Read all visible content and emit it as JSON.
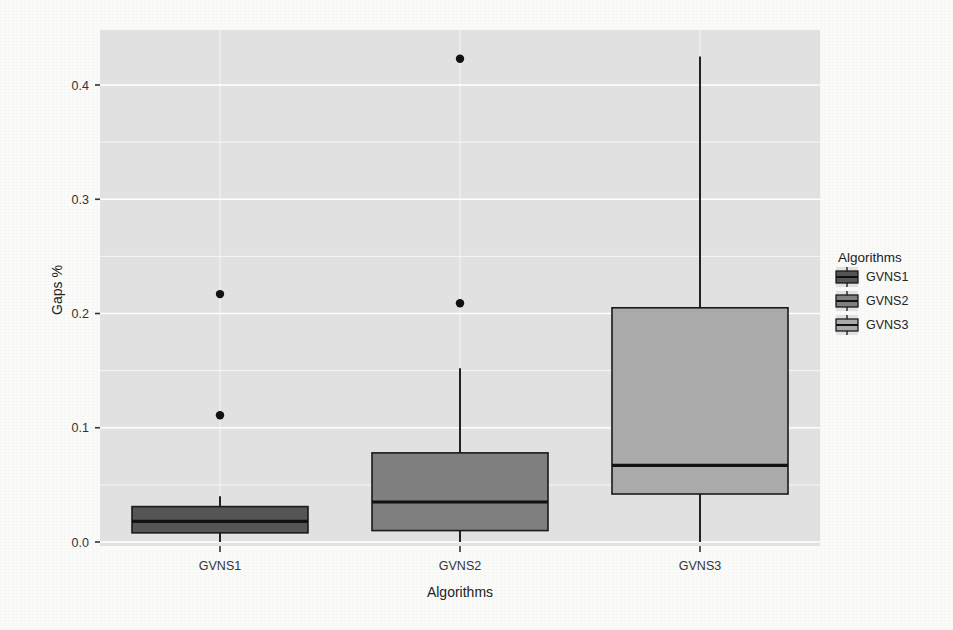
{
  "chart_data": {
    "type": "box",
    "title": "",
    "xlabel": "Algorithms",
    "ylabel": "Gaps %",
    "ylim": [
      -0.02,
      0.45
    ],
    "grid": true,
    "grid_major": true,
    "grid_minor": true,
    "panel_background": "#e0e0e0",
    "grid_color": "#ffffff",
    "legend": {
      "title": "Algorithms",
      "position": "right",
      "entries": [
        {
          "label": "GVNS1",
          "color": "#555555"
        },
        {
          "label": "GVNS2",
          "color": "#7f7f7f"
        },
        {
          "label": "GVNS3",
          "color": "#aaaaaa"
        }
      ]
    },
    "y_ticks": [
      0.0,
      0.1,
      0.2,
      0.3,
      0.4
    ],
    "y_tick_labels": [
      "0.0",
      "0.1",
      "0.2",
      "0.3",
      "0.4"
    ],
    "categories": [
      "GVNS1",
      "GVNS2",
      "GVNS3"
    ],
    "boxes": [
      {
        "category": "GVNS1",
        "color": "#555555",
        "lower_whisker": 0.0,
        "q1": 0.008,
        "median": 0.018,
        "q3": 0.031,
        "upper_whisker": 0.04,
        "outliers": [
          0.111,
          0.217
        ]
      },
      {
        "category": "GVNS2",
        "color": "#7f7f7f",
        "lower_whisker": 0.0,
        "q1": 0.01,
        "median": 0.035,
        "q3": 0.078,
        "upper_whisker": 0.152,
        "outliers": [
          0.209,
          0.423
        ]
      },
      {
        "category": "GVNS3",
        "color": "#aaaaaa",
        "lower_whisker": 0.0,
        "q1": 0.042,
        "median": 0.067,
        "q3": 0.205,
        "upper_whisker": 0.425,
        "outliers": []
      }
    ]
  }
}
